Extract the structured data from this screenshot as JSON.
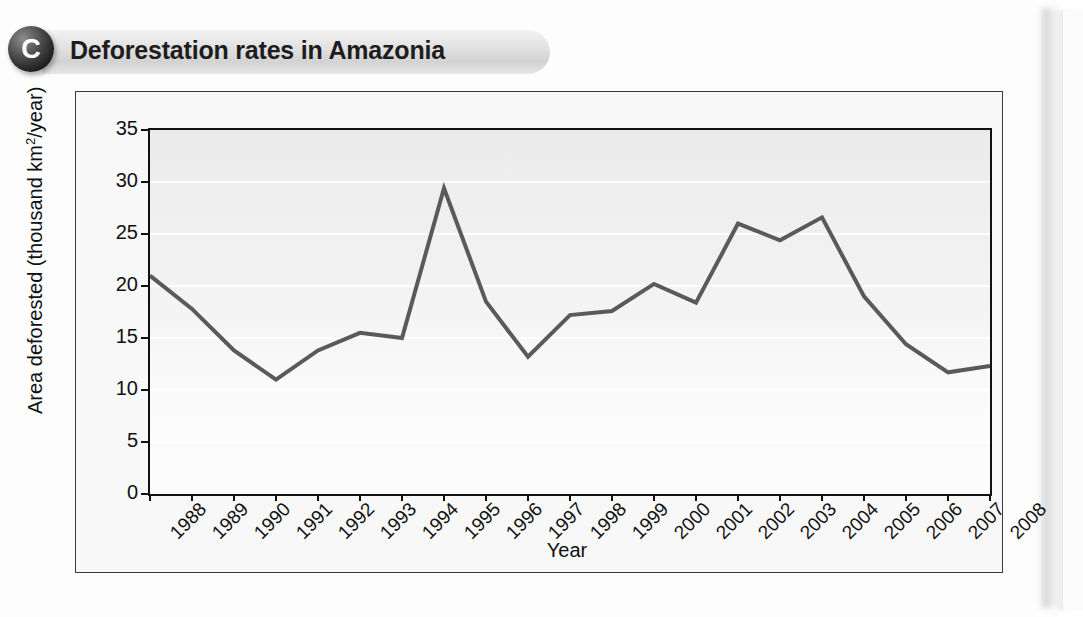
{
  "panel": {
    "badge_letter": "C",
    "title": "Deforestation rates in Amazonia"
  },
  "chart_data": {
    "type": "line",
    "title": "Deforestation rates in Amazonia",
    "xlabel": "Year",
    "ylabel": "Area deforested (thousand km2/year)",
    "ylabel_prefix": "Area deforested (thousand km",
    "ylabel_sup": "2",
    "ylabel_suffix": "/year)",
    "categories": [
      "1988",
      "1989",
      "1990",
      "1991",
      "1992",
      "1993",
      "1994",
      "1995",
      "1996",
      "1997",
      "1998",
      "1999",
      "2000",
      "2001",
      "2002",
      "2003",
      "2004",
      "2005",
      "2006",
      "2007",
      "2008"
    ],
    "values": [
      21.0,
      17.8,
      13.8,
      11.0,
      13.8,
      15.5,
      15.0,
      29.4,
      18.5,
      13.2,
      17.2,
      17.6,
      20.2,
      18.4,
      26.0,
      24.4,
      26.6,
      19.0,
      14.4,
      11.7,
      12.3
    ],
    "ylim": [
      0,
      35
    ],
    "yticks": [
      0,
      5,
      10,
      15,
      20,
      25,
      30,
      35
    ],
    "ytick_labels": [
      "0",
      "5",
      "10",
      "15",
      "20",
      "25",
      "30",
      "35"
    ],
    "grid": true,
    "legend": "none",
    "series_color": "#5a5a5a",
    "axis_color": "#111111",
    "plot_background": "#f2f2f2"
  }
}
